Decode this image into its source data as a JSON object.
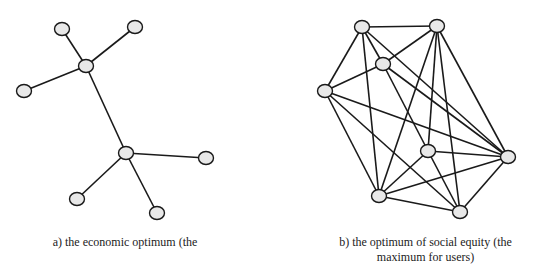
{
  "style": {
    "node_fill": "#e8e8e8",
    "stroke": "#1a1a1a",
    "node_rx": 7.5,
    "node_ry": 6.5,
    "edge_width": 1.6
  },
  "graphs": [
    {
      "id": "a",
      "caption": "a) the economic optimum (the",
      "nodes": [
        {
          "id": "n1",
          "x": 62,
          "y": 29
        },
        {
          "id": "n2",
          "x": 135,
          "y": 27
        },
        {
          "id": "n3",
          "x": 86,
          "y": 66
        },
        {
          "id": "n4",
          "x": 24,
          "y": 91
        },
        {
          "id": "n5",
          "x": 126,
          "y": 153
        },
        {
          "id": "n6",
          "x": 206,
          "y": 158
        },
        {
          "id": "n7",
          "x": 77,
          "y": 199
        },
        {
          "id": "n8",
          "x": 157,
          "y": 213
        }
      ],
      "edges": [
        [
          "n3",
          "n1"
        ],
        [
          "n3",
          "n2"
        ],
        [
          "n3",
          "n4"
        ],
        [
          "n3",
          "n5"
        ],
        [
          "n5",
          "n6"
        ],
        [
          "n5",
          "n7"
        ],
        [
          "n5",
          "n8"
        ]
      ]
    },
    {
      "id": "b",
      "caption": "b) the optimum of social equity (the maximum for users)",
      "caption_lines": [
        "b) the optimum of social equity (the",
        "maximum for users)"
      ],
      "nodes": [
        {
          "id": "A",
          "x": 362,
          "y": 27
        },
        {
          "id": "B",
          "x": 437,
          "y": 26
        },
        {
          "id": "C",
          "x": 383,
          "y": 64
        },
        {
          "id": "D",
          "x": 325,
          "y": 91
        },
        {
          "id": "E",
          "x": 428,
          "y": 151
        },
        {
          "id": "F",
          "x": 508,
          "y": 157
        },
        {
          "id": "G",
          "x": 379,
          "y": 196
        },
        {
          "id": "H",
          "x": 460,
          "y": 212
        }
      ],
      "edges": [
        [
          "A",
          "B"
        ],
        [
          "A",
          "C"
        ],
        [
          "A",
          "D"
        ],
        [
          "A",
          "G"
        ],
        [
          "A",
          "F"
        ],
        [
          "B",
          "C"
        ],
        [
          "B",
          "G"
        ],
        [
          "B",
          "E"
        ],
        [
          "B",
          "H"
        ],
        [
          "B",
          "F"
        ],
        [
          "C",
          "D"
        ],
        [
          "C",
          "F"
        ],
        [
          "C",
          "E"
        ],
        [
          "D",
          "F"
        ],
        [
          "D",
          "G"
        ],
        [
          "D",
          "H"
        ],
        [
          "E",
          "F"
        ],
        [
          "E",
          "G"
        ],
        [
          "E",
          "H"
        ],
        [
          "F",
          "G"
        ],
        [
          "F",
          "H"
        ],
        [
          "G",
          "H"
        ]
      ]
    }
  ]
}
